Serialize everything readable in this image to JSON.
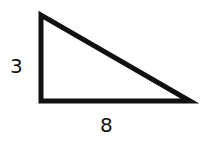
{
  "diagram": {
    "shape": "right-triangle",
    "vertices": [
      [
        41,
        15
      ],
      [
        41,
        101
      ],
      [
        190,
        101
      ]
    ],
    "stroke_color": "#111111",
    "fill_color": "#ffffff",
    "labels": {
      "vertical_side": "3",
      "horizontal_side": "8"
    }
  }
}
